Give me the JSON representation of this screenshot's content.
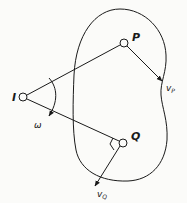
{
  "diagram": {
    "type": "kinematics-instant-center",
    "stroke_color": "#1a1a1a",
    "background": "#fbfbf9",
    "points": {
      "I": {
        "label": "I",
        "x": 23,
        "y": 97
      },
      "P": {
        "label": "P",
        "x": 124,
        "y": 43
      },
      "Q": {
        "label": "Q",
        "x": 123,
        "y": 143
      }
    },
    "vectors": {
      "vP": {
        "label": "v",
        "subscript": "P"
      },
      "vQ": {
        "label": "v",
        "subscript": "Q"
      }
    },
    "angular_velocity": {
      "label": "ω"
    },
    "annotations": [
      "right-angle marker at Q between IQ and vQ",
      "rigid body outline (peanut shape)"
    ]
  }
}
